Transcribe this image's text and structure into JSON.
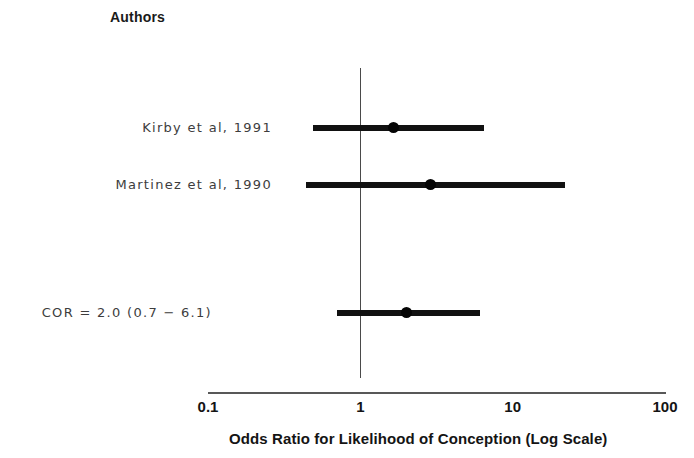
{
  "figure": {
    "width": 694,
    "height": 458,
    "background": "#ffffff",
    "ink_color": "#111111"
  },
  "header": {
    "authors_column_label": "Authors"
  },
  "chart_data": {
    "type": "scatter",
    "subtype": "forest-plot",
    "title": "",
    "xlabel": "Odds Ratio for Likelihood of Conception (Log Scale)",
    "ylabel": "Authors",
    "xscale": "log",
    "xlim": [
      0.1,
      100
    ],
    "xticks": [
      0.1,
      1,
      10,
      100
    ],
    "xtick_labels": [
      "0.1",
      "1",
      "10",
      "100"
    ],
    "grid": false,
    "legend": "none",
    "null_line": 1,
    "rows": [
      {
        "label": "Kirby et al, 1991",
        "kind": "study",
        "odds_ratio": 1.65,
        "ci_low": 0.49,
        "ci_high": 6.5
      },
      {
        "label": "Martinez et al, 1990",
        "kind": "study",
        "odds_ratio": 2.9,
        "ci_low": 0.44,
        "ci_high": 22.0
      },
      {
        "label": "COR = 2.0 (0.7 − 6.1)",
        "kind": "summary",
        "odds_ratio": 2.0,
        "ci_low": 0.7,
        "ci_high": 6.1
      }
    ]
  },
  "axis": {
    "tick_0": "0.1",
    "tick_1": "1",
    "tick_2": "10",
    "tick_3": "100",
    "title": "Odds Ratio for Likelihood of Conception (Log Scale)"
  },
  "labels": {
    "row_0": "Kirby et al, 1991",
    "row_1": "Martinez et al, 1990",
    "row_2": "COR = 2.0 (0.7 − 6.1)"
  }
}
